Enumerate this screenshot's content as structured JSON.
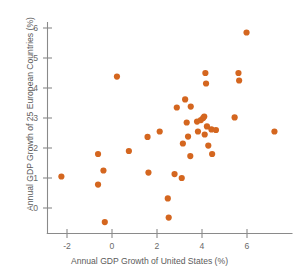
{
  "chart_data": {
    "type": "scatter",
    "title": "",
    "subtitle": "",
    "xlabel": "Annual GDP Growth of United States (%)",
    "ylabel": "Annual GDP Growth of 25 European Countries (%)",
    "xlim": [
      -2.9,
      7.8
    ],
    "ylim": [
      -0.85,
      6.4
    ],
    "xticks": [
      -2,
      0,
      2,
      4,
      6
    ],
    "xtick_labels": [
      "-2",
      "0",
      "2",
      "4",
      "6"
    ],
    "yticks": [
      0,
      1,
      2,
      3,
      4,
      5,
      6
    ],
    "ytick_labels": [
      "0",
      "1",
      "2",
      "3",
      "4",
      "5",
      "6"
    ],
    "grid": false,
    "legend": null,
    "marker_color": "#d4661f",
    "marker_size": 3.1,
    "n_points": 44,
    "points": [
      {
        "x": -2.25,
        "y": 1.05
      },
      {
        "x": -0.62,
        "y": 1.8
      },
      {
        "x": -0.62,
        "y": 0.78
      },
      {
        "x": -0.38,
        "y": 1.25
      },
      {
        "x": -0.32,
        "y": -0.47
      },
      {
        "x": 0.22,
        "y": 4.38
      },
      {
        "x": 0.75,
        "y": 1.9
      },
      {
        "x": 1.58,
        "y": 2.37
      },
      {
        "x": 1.62,
        "y": 1.18
      },
      {
        "x": 2.12,
        "y": 2.55
      },
      {
        "x": 2.48,
        "y": 0.32
      },
      {
        "x": 2.52,
        "y": -0.32
      },
      {
        "x": 2.78,
        "y": 1.13
      },
      {
        "x": 2.88,
        "y": 3.35
      },
      {
        "x": 3.1,
        "y": 1.0
      },
      {
        "x": 3.15,
        "y": 2.15
      },
      {
        "x": 3.25,
        "y": 3.62
      },
      {
        "x": 3.32,
        "y": 2.85
      },
      {
        "x": 3.38,
        "y": 2.38
      },
      {
        "x": 3.48,
        "y": 1.73
      },
      {
        "x": 3.5,
        "y": 3.38
      },
      {
        "x": 3.78,
        "y": 2.88
      },
      {
        "x": 3.82,
        "y": 2.55
      },
      {
        "x": 3.95,
        "y": 2.93
      },
      {
        "x": 4.05,
        "y": 3.0
      },
      {
        "x": 4.1,
        "y": 3.05
      },
      {
        "x": 4.12,
        "y": 2.45
      },
      {
        "x": 4.15,
        "y": 4.5
      },
      {
        "x": 4.18,
        "y": 4.15
      },
      {
        "x": 4.22,
        "y": 2.72
      },
      {
        "x": 4.28,
        "y": 2.08
      },
      {
        "x": 4.42,
        "y": 2.62
      },
      {
        "x": 4.45,
        "y": 1.8
      },
      {
        "x": 4.62,
        "y": 2.6
      },
      {
        "x": 5.45,
        "y": 3.02
      },
      {
        "x": 5.62,
        "y": 4.5
      },
      {
        "x": 5.65,
        "y": 4.25
      },
      {
        "x": 5.98,
        "y": 5.85
      },
      {
        "x": 7.22,
        "y": 2.55
      }
    ]
  },
  "axes": {
    "x_axis_name": "x-axis",
    "y_axis_name": "y-axis"
  }
}
